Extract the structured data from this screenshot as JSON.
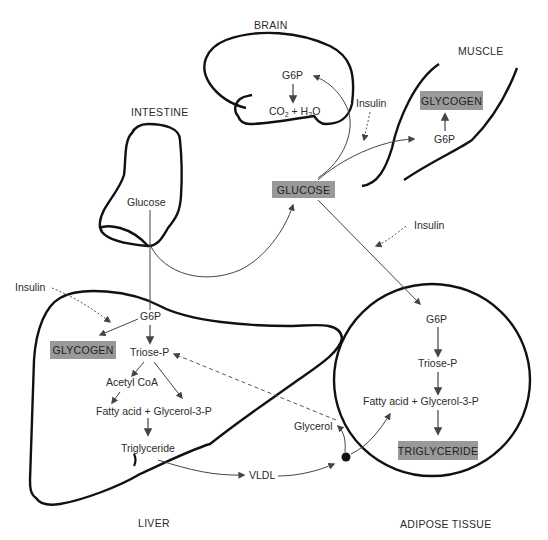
{
  "organs": {
    "brain": "BRAIN",
    "muscle": "MUSCLE",
    "intestine": "INTESTINE",
    "liver": "LIVER",
    "adipose": "ADIPOSE TISSUE"
  },
  "brain": {
    "g6p": "G6P",
    "co2_h2o": "CO2 + H2O"
  },
  "muscle": {
    "glycogen": "GLYCOGEN",
    "g6p": "G6P"
  },
  "intestine": {
    "glucose": "Glucose"
  },
  "blood": {
    "glucose": "GLUCOSE",
    "vldl": "VLDL",
    "glycerol": "Glycerol"
  },
  "insulin": {
    "muscle": "Insulin",
    "adipose": "Insulin",
    "liver": "Insulin"
  },
  "liver": {
    "g6p": "G6P",
    "glycogen": "GLYCOGEN",
    "triose_p": "Triose-P",
    "acetyl_coa": "Acetyl CoA",
    "fatty_acid": "Fatty acid + Glycerol-3-P",
    "triglyceride": "Triglyceride"
  },
  "adipose": {
    "g6p": "G6P",
    "triose_p": "Triose-P",
    "fatty_acid": "Fatty acid + Glycerol-3-P",
    "triglyceride": "TRIGLYCERIDE"
  },
  "colors": {
    "box_fill": "#999999",
    "outline": "#111111",
    "arrow": "#444444"
  }
}
